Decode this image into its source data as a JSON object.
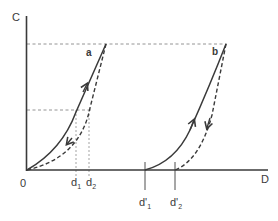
{
  "diagram": {
    "type": "loading-unloading-curves",
    "axes": {
      "y_label": "C",
      "x_label": "D",
      "origin_label": "0"
    },
    "curves": [
      {
        "id": "a",
        "label": "a",
        "loading": "solid",
        "unloading": "dashed",
        "start_loading": "0",
        "end_unloading": "0"
      },
      {
        "id": "b",
        "label": "b",
        "loading": "solid",
        "unloading": "dashed",
        "start_loading": "d'1",
        "end_unloading": "d'2"
      }
    ],
    "x_markers": [
      {
        "label": "d",
        "sub": "1"
      },
      {
        "label": "d",
        "sub": "2"
      },
      {
        "label": "d'",
        "sub": "1"
      },
      {
        "label": "d'",
        "sub": "2"
      }
    ],
    "colors": {
      "line": "#3a3a3a",
      "guide": "#888888",
      "background": "#ffffff"
    }
  }
}
